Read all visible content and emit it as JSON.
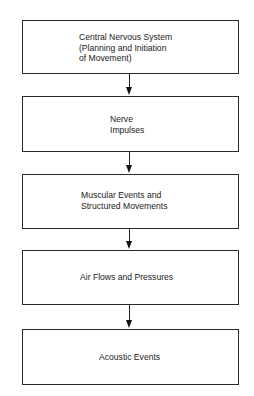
{
  "diagram": {
    "type": "flowchart",
    "direction": "top-to-bottom",
    "nodes": [
      {
        "id": "cns",
        "label": "Central Nervous System\n(Planning and Initiation\nof Movement)"
      },
      {
        "id": "nerve",
        "label": "Nerve\nImpulses"
      },
      {
        "id": "muscular",
        "label": "Muscular Events and\nStructured Movements"
      },
      {
        "id": "air",
        "label": "Air Flows and Pressures"
      },
      {
        "id": "acoustic",
        "label": "Acoustic Events"
      }
    ],
    "edges": [
      {
        "from": "cns",
        "to": "nerve"
      },
      {
        "from": "nerve",
        "to": "muscular"
      },
      {
        "from": "muscular",
        "to": "air"
      },
      {
        "from": "air",
        "to": "acoustic"
      }
    ]
  },
  "colors": {
    "line": "#222222",
    "background": "#ffffff"
  }
}
